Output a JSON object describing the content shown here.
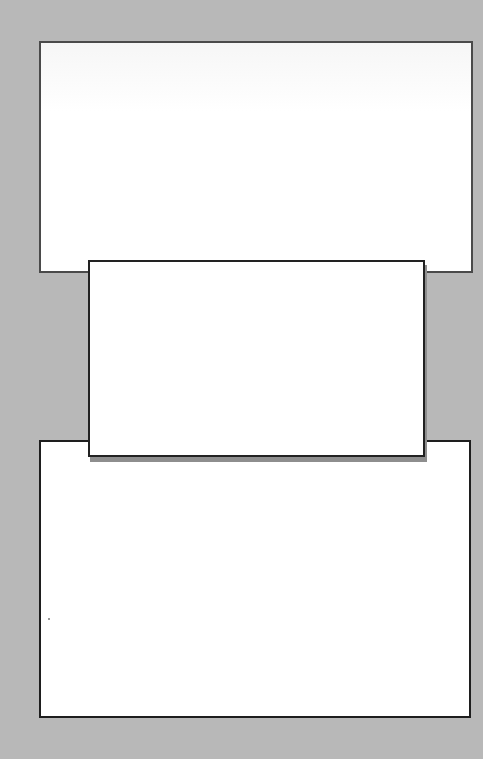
{
  "page": {
    "background_color": "#b8b8b8"
  },
  "panels": [
    {
      "id": "top",
      "content": "",
      "fill": "#ffffff",
      "border_color": "#4a4a4a"
    },
    {
      "id": "middle",
      "content": "",
      "fill": "#ffffff",
      "border_color": "#222222",
      "shadow_color": "#8e8e8e"
    },
    {
      "id": "bottom",
      "content": "",
      "fill": "#ffffff",
      "border_color": "#1e1e1e"
    }
  ]
}
